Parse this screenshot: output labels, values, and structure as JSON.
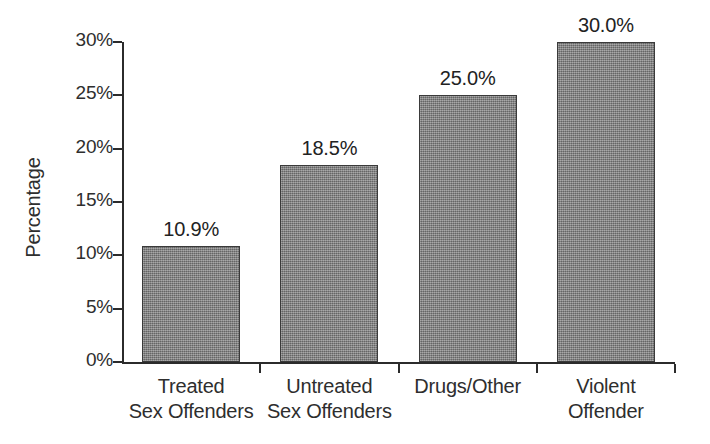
{
  "chart_data": {
    "type": "bar",
    "title": "",
    "xlabel": "",
    "ylabel": "Percentage",
    "categories": [
      "Treated Sex Offenders",
      "Untreated Sex Offenders",
      "Drugs/Other",
      "Violent Offender"
    ],
    "category_lines": [
      [
        "Treated",
        "Sex Offenders"
      ],
      [
        "Untreated",
        "Sex Offenders"
      ],
      [
        "Drugs/Other"
      ],
      [
        "Violent",
        "Offender"
      ]
    ],
    "values": [
      10.9,
      18.5,
      25.0,
      30.0
    ],
    "value_labels": [
      "10.9%",
      "18.5%",
      "25.0%",
      "30.0%"
    ],
    "ylim": [
      0,
      30
    ],
    "ytick_values": [
      0,
      5,
      10,
      15,
      20,
      25,
      30
    ],
    "ytick_labels": [
      "0%",
      "5%",
      "10%",
      "15%",
      "20%",
      "25%",
      "30%"
    ],
    "grid": false,
    "legend": false,
    "legend_position": "none",
    "bar_color": "#7c7c7c",
    "bar_edge_color": "#3a3a3a",
    "axis_color": "#2b2b2b",
    "text_color": "#2e2e2e",
    "background_color": "#ffffff"
  }
}
